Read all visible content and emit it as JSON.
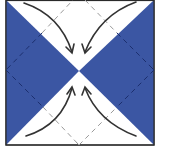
{
  "diagram": {
    "type": "origami-fold-step",
    "colors": {
      "paper_colored": "#3b56a3",
      "paper_white": "#ffffff",
      "outline": "#2a2a2a",
      "valley_fold_on_blue": "#1c2f6e",
      "valley_fold_on_white": "#9a9a9a",
      "arrow": "#333333"
    },
    "elements": {
      "square": "square-paper",
      "blue_triangles": [
        "left-triangle",
        "right-triangle"
      ],
      "white_triangles": [
        "top-triangle",
        "bottom-triangle"
      ],
      "arrows": [
        "top-left-to-center",
        "top-right-to-center",
        "bottom-left-to-center",
        "bottom-right-to-center"
      ],
      "fold_lines": "diamond-valley-folds"
    }
  }
}
